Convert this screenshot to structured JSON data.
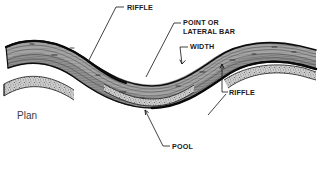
{
  "figure": {
    "caption": "Plan",
    "view_type": "plan"
  },
  "labels": {
    "riffle_top": "RIFFLE",
    "point_bar_line1": "POINT OR",
    "point_bar_line2": "LATERAL BAR",
    "width": "WIDTH",
    "riffle_right": "RIFFLE",
    "pool": "POOL",
    "plan": "Plan"
  },
  "colors": {
    "background": "#ffffff",
    "ink": "#1a1a1a",
    "channel_fill_light": "#b9b9b9",
    "channel_fill_mid": "#9a9a9a",
    "channel_fill_dark": "#6f6f6f",
    "bank_line": "#111111",
    "bar_stipple": "#8d8d8d",
    "plan_text": "#3a3a3a"
  },
  "leaders": [
    {
      "name": "riffle-top-leader",
      "from": [
        124,
        7
      ],
      "to": [
        88,
        62
      ]
    },
    {
      "name": "point-bar-leader",
      "from": [
        180,
        29
      ],
      "to": [
        146,
        76
      ]
    },
    {
      "name": "width-leader",
      "from": [
        187,
        47
      ],
      "to": [
        180,
        64
      ]
    },
    {
      "name": "riffle-right-leader",
      "from": [
        226,
        92
      ],
      "to": [
        222,
        64
      ]
    },
    {
      "name": "pool-leader",
      "from": [
        169,
        146
      ],
      "to": [
        145,
        110
      ]
    }
  ],
  "features": [
    {
      "name": "riffle-bar-left",
      "type": "gravel-riffle"
    },
    {
      "name": "point-bar-center",
      "type": "point-or-lateral-bar"
    },
    {
      "name": "riffle-bar-right",
      "type": "gravel-riffle"
    },
    {
      "name": "pool-center",
      "type": "pool"
    },
    {
      "name": "channel-width-marker",
      "type": "width"
    }
  ]
}
